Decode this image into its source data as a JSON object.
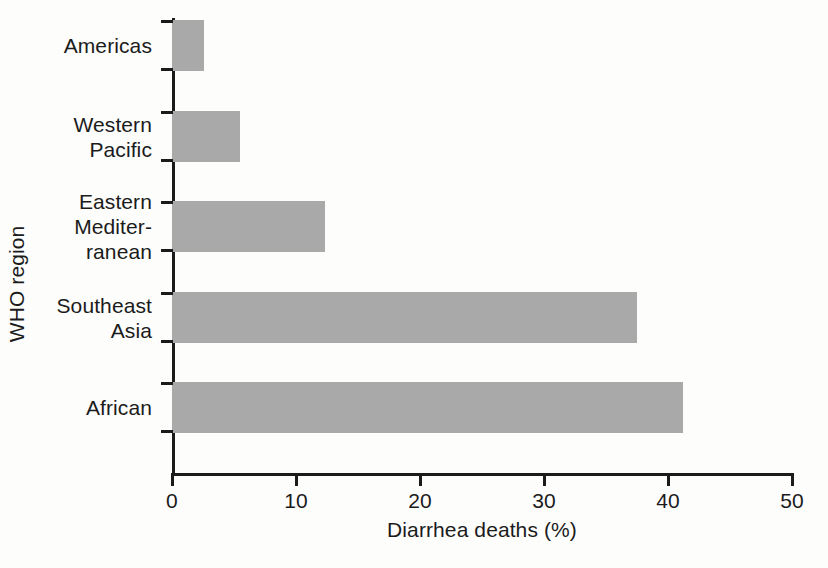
{
  "chart_data": {
    "type": "bar",
    "orientation": "horizontal",
    "title": "",
    "xlabel": "Diarrhea deaths (%)",
    "ylabel": "WHO region",
    "categories": [
      "Americas",
      "Western\nPacific",
      "Eastern\nMediter-\nranean",
      "Southeast\nAsia",
      "African"
    ],
    "values": [
      2.6,
      5.5,
      12.3,
      37.5,
      41.2
    ],
    "xlim": [
      0,
      50
    ],
    "xticks": [
      0,
      10,
      20,
      30,
      40,
      50
    ],
    "xticklabels": [
      "0",
      "10",
      "20",
      "30",
      "40",
      "50"
    ],
    "grid": false,
    "legend": false,
    "bar_color": "#a9a9a9",
    "axis_color": "#1b1b1b"
  }
}
